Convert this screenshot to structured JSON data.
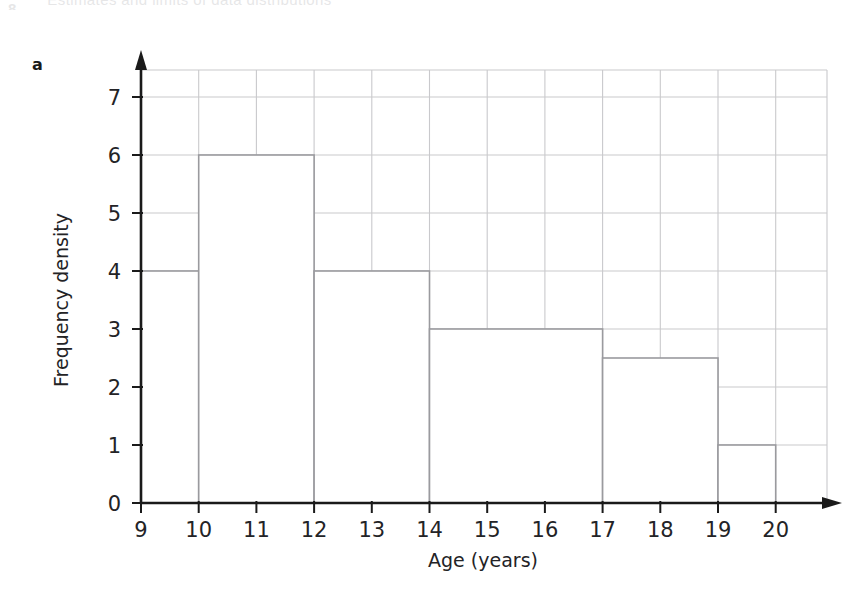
{
  "page": {
    "running_header_number": "8",
    "running_header_title": "Estimates and limits of data distributions",
    "part_label": "a"
  },
  "chart_data": {
    "type": "bar",
    "subtype": "histogram",
    "title": "",
    "xlabel": "Age (years)",
    "ylabel": "Frequency density",
    "xlim": [
      9,
      20
    ],
    "ylim": [
      0,
      7.5
    ],
    "xticks": [
      "9",
      "10",
      "11",
      "12",
      "13",
      "14",
      "15",
      "16",
      "17",
      "18",
      "19",
      "20"
    ],
    "xtick_values": [
      9,
      10,
      11,
      12,
      13,
      14,
      15,
      16,
      17,
      18,
      19,
      20
    ],
    "yticks": [
      "0",
      "1",
      "2",
      "3",
      "4",
      "5",
      "6",
      "7"
    ],
    "ytick_values": [
      0,
      1,
      2,
      3,
      4,
      5,
      6,
      7
    ],
    "grid": true,
    "grid_color": "#c9c9cc",
    "legend": "none",
    "bar_fill": "#ffffff",
    "bar_stroke": "#9a9a9e",
    "axis_color": "#1a1a1a",
    "bins": [
      {
        "label": "9-10",
        "x_start": 9,
        "x_end": 10,
        "frequency_density": 4,
        "frequency": 4
      },
      {
        "label": "10-12",
        "x_start": 10,
        "x_end": 12,
        "frequency_density": 6,
        "frequency": 12
      },
      {
        "label": "12-14",
        "x_start": 12,
        "x_end": 14,
        "frequency_density": 4,
        "frequency": 8
      },
      {
        "label": "14-17",
        "x_start": 14,
        "x_end": 17,
        "frequency_density": 3,
        "frequency": 9
      },
      {
        "label": "17-19",
        "x_start": 17,
        "x_end": 19,
        "frequency_density": 2.5,
        "frequency": 5
      },
      {
        "label": "19-20",
        "x_start": 19,
        "x_end": 20,
        "frequency_density": 1,
        "frequency": 1
      }
    ]
  }
}
